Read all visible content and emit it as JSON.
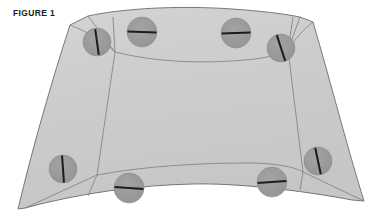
{
  "figure": {
    "label": "FIGURE 1",
    "background_color": "#ffffff",
    "panel_fill": "#cccccc",
    "panel_fill_light": "#d2d2d2",
    "panel_fill_flap": "#c4c4c4",
    "panel_fill_corner": "#c9c9c9",
    "outline_color": "#6b6b6b",
    "fold_line_color": "#7a7a7a",
    "grommet_fill": "#999999",
    "grommet_stroke": "#8c8c8c",
    "slash_color": "#1c1c1c",
    "outline_width": 0.9,
    "fold_width": 0.75
  },
  "geometry": {
    "body_outline": "M 88,16 C 120,9 175,5 232,9 C 262,11 285,14 300,17 L 313,22 C 330,80 348,150 364,201 L 352,200 C 300,190 235,183 193,184 C 140,185 80,193 25,208 L 18,209 C 32,150 52,80 70,25 Z",
    "top_edge": "M 88,16 C 130,28 175,32 232,26 C 262,23 288,19 300,17",
    "bottom_edge": "M 25,208 C 80,193 140,185 193,184 C 235,183 300,190 352,200",
    "left_edge": "M 88,16 L 70,25 C 52,80 32,150 18,209 L 25,208",
    "right_edge": "M 300,17 L 313,22 C 330,80 348,150 364,201 L 352,200",
    "inner_panel": "M 115,52 L 288,50 L 303,172 L 97,175 Z",
    "fold_top": "M 115,52 C 155,62 200,64 245,60 C 268,58 282,54 288,50",
    "fold_bottom": "M 97,175 C 145,166 200,163 248,163 C 275,163 295,167 303,172",
    "fold_left": "M 115,52 L 97,175",
    "fold_right": "M 288,50 L 303,172",
    "corner_tl_a": "M 88,16 L 115,52",
    "corner_tl_b": "M 70,25 C 88,32 104,42 115,52",
    "corner_tr_a": "M 300,17 L 288,50",
    "corner_tr_b": "M 313,22 C 303,30 294,40 288,50",
    "corner_bl_a": "M 25,208 L 97,175",
    "corner_bl_b": "M 25,208 C 50,198 76,186 97,175",
    "corner_br_a": "M 364,201 L 303,172",
    "corner_br_b": "M 352,200 C 330,190 312,180 303,172",
    "seam_bl": "M 97,175 L 88,196",
    "seam_br": "M 303,172 L 300,190",
    "seam_tl": "M 115,52 L 113,17",
    "seam_tr": "M 288,50 L 293,17"
  },
  "grommets": [
    {
      "name": "grommet-top-left-corner",
      "cx": 97,
      "cy": 42,
      "r": 14,
      "slash_angle": 82,
      "slash_len": 26,
      "slash_w": 2.0
    },
    {
      "name": "grommet-top-left",
      "cx": 142,
      "cy": 32,
      "r": 15,
      "slash_angle": 2,
      "slash_len": 29,
      "slash_w": 2.1
    },
    {
      "name": "grommet-top-right",
      "cx": 236,
      "cy": 33,
      "r": 15,
      "slash_angle": 358,
      "slash_len": 29,
      "slash_w": 2.1
    },
    {
      "name": "grommet-right-upper",
      "cx": 281,
      "cy": 48,
      "r": 14,
      "slash_angle": 72,
      "slash_len": 27,
      "slash_w": 2.0
    },
    {
      "name": "grommet-left-lower",
      "cx": 63,
      "cy": 169,
      "r": 14,
      "slash_angle": 86,
      "slash_len": 27,
      "slash_w": 2.0
    },
    {
      "name": "grommet-bottom-left",
      "cx": 129,
      "cy": 188,
      "r": 15,
      "slash_angle": 4,
      "slash_len": 29,
      "slash_w": 2.1
    },
    {
      "name": "grommet-bottom-right",
      "cx": 272,
      "cy": 182,
      "r": 15,
      "slash_angle": 356,
      "slash_len": 29,
      "slash_w": 2.1
    },
    {
      "name": "grommet-right-lower",
      "cx": 318,
      "cy": 161,
      "r": 14,
      "slash_angle": 78,
      "slash_len": 27,
      "slash_w": 2.0
    }
  ]
}
